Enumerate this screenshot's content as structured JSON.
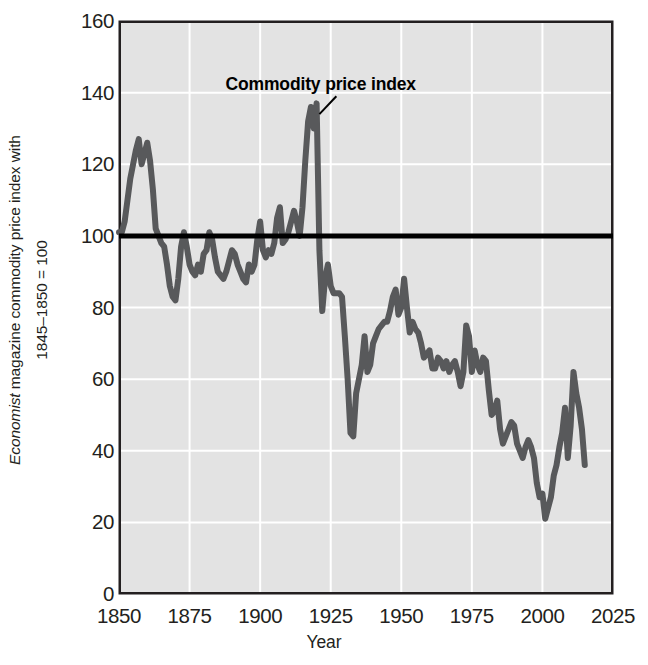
{
  "chart_data": {
    "type": "line",
    "title": "",
    "xlabel": "Year",
    "ylabel_line1": "Economist magazine commodity price index with",
    "ylabel_line1_italic": "Economist",
    "ylabel_line1_rest": " magazine commodity price index with",
    "ylabel_line2": "1845–1850 = 100",
    "xlim": [
      1850,
      2025
    ],
    "ylim": [
      0,
      160
    ],
    "xticks": [
      1850,
      1875,
      1900,
      1925,
      1950,
      1975,
      2000,
      2025
    ],
    "yticks": [
      0,
      20,
      40,
      60,
      80,
      100,
      120,
      140,
      160
    ],
    "grid": true,
    "legend": "none",
    "annotations": [
      {
        "text": "Commodity price index",
        "x": 1925,
        "y": 142,
        "leader_from_x": 1921,
        "leader_from_y": 134,
        "leader_to_x": 1927,
        "leader_to_y": 139
      }
    ],
    "reference_line": {
      "label": "1845–1850 = 100 baseline",
      "y": 100,
      "color": "#000000",
      "width_px": 5
    },
    "series": [
      {
        "name": "Commodity price index",
        "color": "#58595b",
        "width_px": 6,
        "x": [
          1850,
          1851,
          1852,
          1853,
          1854,
          1855,
          1856,
          1857,
          1858,
          1859,
          1860,
          1861,
          1862,
          1863,
          1864,
          1865,
          1866,
          1867,
          1868,
          1869,
          1870,
          1871,
          1872,
          1873,
          1874,
          1875,
          1876,
          1877,
          1878,
          1879,
          1880,
          1881,
          1882,
          1883,
          1884,
          1885,
          1886,
          1887,
          1888,
          1889,
          1890,
          1891,
          1892,
          1893,
          1894,
          1895,
          1896,
          1897,
          1898,
          1899,
          1900,
          1901,
          1902,
          1903,
          1904,
          1905,
          1906,
          1907,
          1908,
          1909,
          1910,
          1911,
          1912,
          1913,
          1914,
          1915,
          1916,
          1917,
          1918,
          1919,
          1920,
          1921,
          1922,
          1923,
          1924,
          1925,
          1926,
          1927,
          1928,
          1929,
          1930,
          1931,
          1932,
          1933,
          1934,
          1935,
          1936,
          1937,
          1938,
          1939,
          1940,
          1941,
          1942,
          1943,
          1944,
          1945,
          1946,
          1947,
          1948,
          1949,
          1950,
          1951,
          1952,
          1953,
          1954,
          1955,
          1956,
          1957,
          1958,
          1959,
          1960,
          1961,
          1962,
          1963,
          1964,
          1965,
          1966,
          1967,
          1968,
          1969,
          1970,
          1971,
          1972,
          1973,
          1974,
          1975,
          1976,
          1977,
          1978,
          1979,
          1980,
          1981,
          1982,
          1983,
          1984,
          1985,
          1986,
          1987,
          1988,
          1989,
          1990,
          1991,
          1992,
          1993,
          1994,
          1995,
          1996,
          1997,
          1998,
          1999,
          2000,
          2001,
          2002,
          2003,
          2004,
          2005,
          2006,
          2007,
          2008,
          2009,
          2010,
          2011,
          2012,
          2013,
          2014,
          2015
        ],
        "values": [
          101,
          101,
          104,
          110,
          116,
          120,
          124,
          127,
          120,
          123,
          126,
          121,
          113,
          102,
          100,
          98,
          97,
          92,
          86,
          83,
          82,
          88,
          97,
          101,
          97,
          92,
          90,
          89,
          92,
          90,
          95,
          96,
          101,
          99,
          94,
          90,
          89,
          88,
          90,
          93,
          96,
          95,
          92,
          90,
          88,
          87,
          92,
          90,
          92,
          99,
          104,
          96,
          94,
          96,
          95,
          98,
          105,
          108,
          98,
          99,
          101,
          104,
          107,
          104,
          100,
          108,
          121,
          132,
          136,
          130,
          137,
          96,
          79,
          88,
          92,
          86,
          84,
          84,
          84,
          83,
          72,
          60,
          45,
          44,
          56,
          60,
          64,
          72,
          62,
          64,
          70,
          72,
          74,
          75,
          76,
          76,
          79,
          83,
          85,
          78,
          80,
          88,
          80,
          73,
          76,
          74,
          73,
          70,
          66,
          67,
          68,
          63,
          63,
          66,
          65,
          63,
          65,
          62,
          64,
          65,
          62,
          58,
          62,
          75,
          72,
          62,
          68,
          64,
          62,
          66,
          65,
          57,
          50,
          51,
          54,
          46,
          42,
          44,
          46,
          48,
          47,
          42,
          40,
          38,
          41,
          43,
          41,
          38,
          31,
          27,
          28,
          21,
          24,
          27,
          33,
          36,
          41,
          45,
          52,
          38,
          47,
          62,
          56,
          52,
          46,
          36
        ]
      }
    ]
  },
  "plot_geometry": {
    "left_px": 119,
    "right_px": 613,
    "top_px": 21,
    "bottom_px": 594,
    "bg_color": "#e3e3e3",
    "grid_color": "#ffffff",
    "border_color": "#231f20"
  }
}
